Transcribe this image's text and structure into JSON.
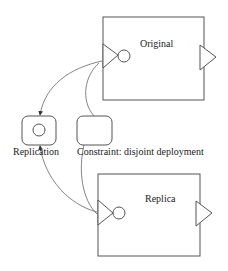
{
  "diagram": {
    "components": [
      {
        "id": "original",
        "label": "Original"
      },
      {
        "id": "replica",
        "label": "Replica"
      }
    ],
    "nodes": [
      {
        "id": "replication",
        "label": "Replication"
      },
      {
        "id": "constraint",
        "label": "Constraint: disjoint deployment"
      }
    ],
    "edges": [
      {
        "from": "original.in-port",
        "to": "replication",
        "arrow": true
      },
      {
        "from": "replica.in-port",
        "to": "replication",
        "arrow": true
      },
      {
        "from": "constraint",
        "to": "original.in-port",
        "arrow": false
      },
      {
        "from": "constraint",
        "to": "replica.in-port",
        "arrow": false
      }
    ],
    "colors": {
      "stroke": "#555555",
      "background": "#ffffff"
    }
  }
}
